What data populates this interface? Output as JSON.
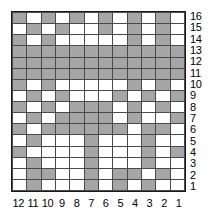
{
  "chart_data": {
    "type": "heatmap",
    "title": "",
    "xlabel": "",
    "ylabel": "",
    "grid": true,
    "legend": "none",
    "n_columns": 12,
    "n_rows": 16,
    "column_labels": [
      "12",
      "11",
      "10",
      "9",
      "8",
      "7",
      "6",
      "5",
      "4",
      "3",
      "2",
      "1"
    ],
    "row_labels": [
      "16",
      "15",
      "14",
      "13",
      "12",
      "11",
      "10",
      "9",
      "8",
      "7",
      "6",
      "5",
      "4",
      "3",
      "2",
      "1"
    ],
    "cell_states": {
      "filled": 1,
      "empty": 0
    },
    "colors": {
      "filled": "#a6a6a6",
      "empty": "#ffffff",
      "grid_line": "#4a4a4a",
      "border": "#1a1a1a",
      "label_text": "#000000",
      "background": "#ffffff"
    },
    "column_group_separators_after_label": [
      "9",
      "5"
    ],
    "row_group_separators_below_label": [
      "6"
    ],
    "rows": [
      {
        "label": "16",
        "values": [
          1,
          0,
          1,
          0,
          1,
          0,
          1,
          0,
          1,
          0,
          1,
          0
        ]
      },
      {
        "label": "15",
        "values": [
          0,
          1,
          0,
          1,
          0,
          0,
          1,
          0,
          1,
          0,
          1,
          0
        ]
      },
      {
        "label": "14",
        "values": [
          1,
          0,
          1,
          0,
          0,
          0,
          0,
          0,
          1,
          0,
          1,
          0
        ]
      },
      {
        "label": "13",
        "values": [
          1,
          1,
          1,
          1,
          1,
          1,
          1,
          1,
          1,
          1,
          1,
          1
        ]
      },
      {
        "label": "12",
        "values": [
          1,
          1,
          1,
          1,
          1,
          1,
          1,
          1,
          1,
          1,
          1,
          1
        ]
      },
      {
        "label": "11",
        "values": [
          1,
          1,
          1,
          1,
          1,
          1,
          1,
          1,
          1,
          1,
          1,
          1
        ]
      },
      {
        "label": "10",
        "values": [
          1,
          0,
          1,
          0,
          0,
          0,
          0,
          0,
          1,
          0,
          1,
          0
        ]
      },
      {
        "label": "9",
        "values": [
          0,
          1,
          0,
          1,
          0,
          0,
          0,
          1,
          0,
          1,
          0,
          1
        ]
      },
      {
        "label": "8",
        "values": [
          1,
          0,
          1,
          0,
          1,
          1,
          1,
          0,
          1,
          0,
          1,
          0
        ]
      },
      {
        "label": "7",
        "values": [
          0,
          1,
          0,
          1,
          1,
          1,
          1,
          0,
          1,
          0,
          0,
          1
        ]
      },
      {
        "label": "6",
        "values": [
          1,
          0,
          1,
          1,
          1,
          1,
          1,
          1,
          0,
          1,
          1,
          0
        ]
      },
      {
        "label": "5",
        "values": [
          0,
          1,
          0,
          0,
          0,
          1,
          0,
          0,
          0,
          1,
          0,
          0
        ]
      },
      {
        "label": "4",
        "values": [
          1,
          0,
          0,
          0,
          0,
          1,
          0,
          0,
          0,
          1,
          0,
          1
        ]
      },
      {
        "label": "3",
        "values": [
          0,
          1,
          0,
          0,
          0,
          1,
          0,
          0,
          0,
          1,
          0,
          0
        ]
      },
      {
        "label": "2",
        "values": [
          0,
          1,
          1,
          0,
          0,
          1,
          0,
          1,
          1,
          0,
          1,
          0
        ]
      },
      {
        "label": "1",
        "values": [
          0,
          1,
          0,
          0,
          0,
          1,
          0,
          1,
          0,
          1,
          0,
          0
        ]
      }
    ]
  }
}
